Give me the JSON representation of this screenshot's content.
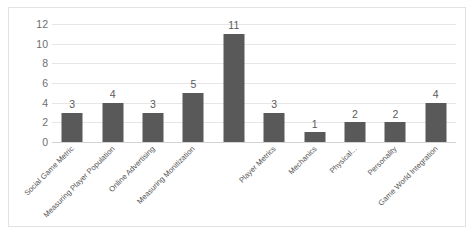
{
  "figure": {
    "background_color": "#ffffff",
    "frame_color": "#e2e2e2"
  },
  "chart_data": {
    "type": "bar",
    "title": "",
    "subtitle": "",
    "xlabel": "",
    "ylabel": "",
    "categories": [
      "Social Game Metric",
      "Measuring Player Population",
      "Online Advertising",
      "Measuring Monitization",
      "",
      "Player Metrics",
      "Mechanics",
      "Physical...",
      "Personality",
      "Game World Integration"
    ],
    "values": [
      3,
      4,
      3,
      5,
      11,
      3,
      1,
      2,
      2,
      4
    ],
    "value_labels": [
      "3",
      "4",
      "3",
      "5",
      "11",
      "3",
      "1",
      "2",
      "2",
      "4"
    ],
    "ylim": [
      0,
      12
    ],
    "yticks": [
      0,
      2,
      4,
      6,
      8,
      10,
      12
    ],
    "ytick_labels": [
      "0",
      "2",
      "4",
      "6",
      "8",
      "10",
      "12"
    ],
    "grid": true,
    "grid_axis": "y",
    "legend": false,
    "legend_position": "none",
    "bar_color": "#595959",
    "gridline_color": "#e6e6e6",
    "axis_line_color": "#d2d2d2",
    "tick_label_color": "#6e6e6e",
    "value_label_color": "#5a5a5a",
    "category_label_color": "#555555",
    "category_label_rotation": -45
  }
}
